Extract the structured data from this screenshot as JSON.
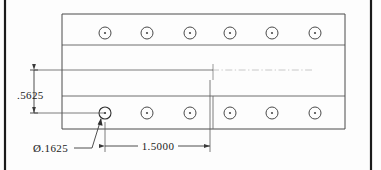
{
  "drawing": {
    "type": "engineering-detail-view",
    "background_color": "#fdfdfd",
    "line_color": "#3a3a3a",
    "border_color": "#1a1a1a",
    "text_color": "#1b1b1b",
    "centerline_color": "#b9b9b9",
    "page_border": {
      "left_x": 5,
      "right_x": 371,
      "top_y": 0,
      "bottom_y": 170
    },
    "part": {
      "name": "perforated-flat-bar",
      "left": 62,
      "right": 345,
      "top": 14,
      "bottom": 129,
      "edges": [
        {
          "name": "top-edge",
          "y": 14
        },
        {
          "name": "upper-band-line",
          "y": 45
        },
        {
          "name": "lower-band-line",
          "y": 96
        },
        {
          "name": "bottom-edge",
          "y": 129
        }
      ]
    },
    "hole_rows": [
      {
        "name": "top-hole-row",
        "cy": 33,
        "r_outer": 6.0,
        "r_center": 1.1,
        "cx": [
          105,
          147,
          190,
          230,
          272,
          315
        ]
      },
      {
        "name": "bottom-hole-row",
        "cy": 113,
        "r_outer": 6.0,
        "r_center": 1.1,
        "cx": [
          105,
          147,
          190,
          230,
          272,
          315
        ]
      }
    ],
    "centerline": {
      "name": "horizontal-centerline",
      "y": 70,
      "x_start": 210,
      "x_end": 312
    },
    "dimensions": [
      {
        "id": "vertical-pitch",
        "name": "dimension-5625",
        "value": ".5625",
        "orientation": "vertical",
        "x": 34,
        "y_top": 70,
        "y_bottom": 113,
        "text_x": 17,
        "text_y": 95,
        "ext_line_top_x2": 213,
        "ext_line_bottom_x2": 105
      },
      {
        "id": "horizontal-pitch",
        "name": "dimension-15000",
        "value": "1.5000",
        "orientation": "horizontal",
        "y": 146,
        "x_left": 105,
        "x_right": 210,
        "text_x": 157,
        "text_y": 150
      },
      {
        "id": "hole-diameter",
        "name": "dimension-diameter-1625",
        "value": "Ø.1625",
        "orientation": "leader",
        "text_x": 34,
        "text_y": 152,
        "leader_shoulder_x1": 78,
        "leader_shoulder_x2": 92,
        "leader_shoulder_y": 148,
        "leader_tip_x": 101,
        "leader_tip_y": 118
      }
    ]
  }
}
